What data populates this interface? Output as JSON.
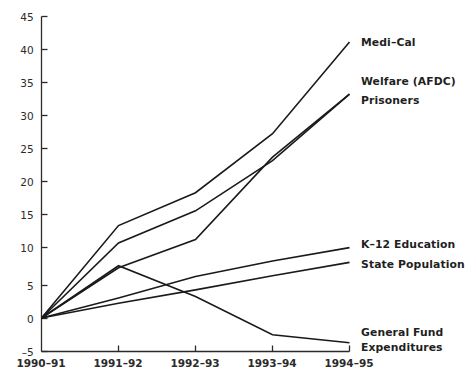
{
  "chart_data": {
    "type": "line",
    "title": "",
    "subtitle": "",
    "xlabel": "",
    "ylabel": "",
    "categories": [
      "1990-91",
      "1991-92",
      "1992-93",
      "1993-94",
      "1994-95"
    ],
    "x_tick_labels": [
      "1990–91",
      "1991–92",
      "1992–93",
      "1993–94",
      "1994–95"
    ],
    "y_tick_labels": [
      "45",
      "40",
      "35",
      "30",
      "25",
      "20",
      "15",
      "10",
      "5",
      "0",
      "–5"
    ],
    "y_ticks": [
      45,
      40,
      35,
      30,
      25,
      20,
      15,
      10,
      5,
      0,
      -5
    ],
    "ylim": [
      -5,
      45
    ],
    "xlim": [
      0,
      4
    ],
    "grid": false,
    "legend": "inline-right-labels",
    "series": [
      {
        "name": "Medi–Cal",
        "label": "Medi–Cal",
        "values": [
          0,
          13.8,
          18.7,
          27.5,
          41.2
        ],
        "color": "#1a1a1a"
      },
      {
        "name": "Welfare (AFDC)",
        "label": "Welfare (AFDC)",
        "values": [
          0,
          11.2,
          16.0,
          23.5,
          33.4
        ],
        "color": "#1a1a1a"
      },
      {
        "name": "Prisoners",
        "label": "Prisoners",
        "values": [
          0,
          7.5,
          11.7,
          24.0,
          33.4
        ],
        "color": "#1a1a1a"
      },
      {
        "name": "K–12 Education",
        "label": "K–12 Education",
        "values": [
          0,
          3.0,
          6.2,
          8.5,
          10.5
        ],
        "color": "#1a1a1a"
      },
      {
        "name": "State Population",
        "label": "State Population",
        "values": [
          0,
          2.2,
          4.2,
          6.3,
          8.3
        ],
        "color": "#1a1a1a"
      },
      {
        "name": "General Fund Expenditures",
        "label": "General Fund Expenditures",
        "label_line1": "General Fund",
        "label_line2": "Expenditures",
        "values": [
          0,
          7.8,
          3.2,
          -2.5,
          -3.7
        ],
        "color": "#1a1a1a"
      }
    ],
    "annotations": []
  },
  "labels": {
    "medi_cal": "Medi–Cal",
    "welfare": "Welfare (AFDC)",
    "prisoners": "Prisoners",
    "k12": "K–12 Education",
    "state_population": "State Population",
    "general_fund_line1": "General Fund",
    "general_fund_line2": "Expenditures"
  },
  "yticks": {
    "t45": "45",
    "t40": "40",
    "t35": "35",
    "t30": "30",
    "t25": "25",
    "t20": "20",
    "t15": "15",
    "t10": "10",
    "t5": "5",
    "t0": "0",
    "tm5": "–5"
  },
  "xticks": {
    "t0": "1990–91",
    "t1": "1991–92",
    "t2": "1992–93",
    "t3": "1993–94",
    "t4": "1994–95"
  },
  "style": {
    "ink": "#1a1a1a",
    "background": "#ffffff"
  }
}
